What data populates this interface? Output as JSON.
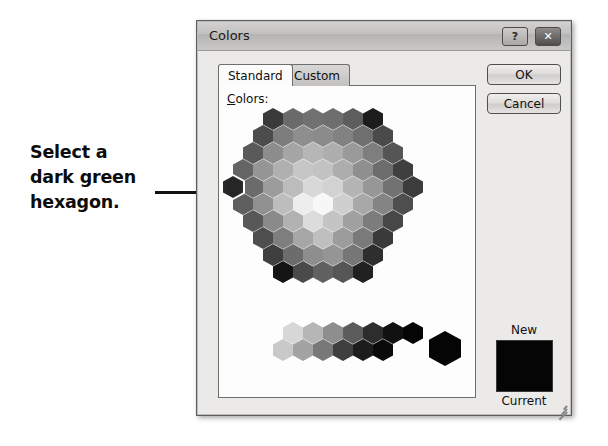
{
  "annotation": {
    "lines": [
      "Select a",
      "dark green",
      "hexagon."
    ],
    "leader_line": "pointer-line"
  },
  "dialog": {
    "title": "Colors",
    "titlebar_buttons": [
      {
        "name": "help-button",
        "glyph": "?"
      },
      {
        "name": "close-button",
        "glyph": "✕"
      }
    ],
    "tabs": [
      {
        "label": "Standard",
        "active": true
      },
      {
        "label": "Custom",
        "active": false
      }
    ],
    "colors_label": {
      "accel": "C",
      "rest": "olors:"
    },
    "buttons": {
      "ok": "OK",
      "cancel": "Cancel"
    },
    "preview": {
      "new_label": "New",
      "current_label": "Current",
      "swatch_color": "#050505"
    }
  },
  "palette": {
    "selected_index": 30,
    "honeycomb_rows": [
      {
        "offset": 44,
        "colors": [
          "#3a3a3a",
          "#6a6a6a",
          "#717171",
          "#6e6e6e",
          "#5d5d5d",
          "#1d1d1d"
        ]
      },
      {
        "offset": 34,
        "colors": [
          "#4c4c4c",
          "#7d7d7d",
          "#8e8e8e",
          "#8b8b8b",
          "#828282",
          "#6f6f6f",
          "#4a4a4a"
        ]
      },
      {
        "offset": 24,
        "colors": [
          "#5a5a5a",
          "#8d8d8d",
          "#a5a5a5",
          "#b6b6b6",
          "#aeaeae",
          "#9a9a9a",
          "#7e7e7e",
          "#555555"
        ]
      },
      {
        "offset": 14,
        "colors": [
          "#646464",
          "#959595",
          "#b0b0b0",
          "#c6c6c6",
          "#c2c2c2",
          "#adadad",
          "#8f8f8f",
          "#6d6d6d",
          "#3f3f3f"
        ]
      },
      {
        "offset": 4,
        "colors": [
          "#2a2a2a",
          "#6b6b6b",
          "#9c9c9c",
          "#bcbcbc",
          "#d8d8d8",
          "#d2d2d2",
          "#b4b4b4",
          "#979797",
          "#727272",
          "#3c3c3c"
        ]
      },
      {
        "offset": 14,
        "colors": [
          "#5f5f5f",
          "#909090",
          "#bdbdbd",
          "#ededed",
          "#f7f7f7",
          "#cfcfcf",
          "#a8a8a8",
          "#848484",
          "#4e4e4e"
        ]
      },
      {
        "offset": 24,
        "colors": [
          "#585858",
          "#8a8a8a",
          "#b2b2b2",
          "#dcdcdc",
          "#c4c4c4",
          "#a0a0a0",
          "#7c7c7c",
          "#474747"
        ]
      },
      {
        "offset": 34,
        "colors": [
          "#4e4e4e",
          "#7e7e7e",
          "#a6a6a6",
          "#bfbfbf",
          "#9c9c9c",
          "#7a7a7a",
          "#3a3a3a"
        ]
      },
      {
        "offset": 44,
        "colors": [
          "#3f3f3f",
          "#6c6c6c",
          "#8e8e8e",
          "#959595",
          "#767676",
          "#2e2e2e"
        ]
      },
      {
        "offset": 54,
        "colors": [
          "#141414",
          "#4a4a4a",
          "#616161",
          "#565656",
          "#212121"
        ]
      }
    ],
    "gray_strip_rows": [
      {
        "offset": 64,
        "colors": [
          "#d7d7d7",
          "#b6b6b6",
          "#8e8e8e",
          "#5c5c5c",
          "#2d2d2d",
          "#111111",
          "#050505"
        ]
      },
      {
        "offset": 54,
        "colors": [
          "#c9c9c9",
          "#a3a3a3",
          "#787878",
          "#3f3f3f",
          "#1c1c1c",
          "#0a0a0a"
        ]
      }
    ],
    "big_hex_color": "#050505"
  }
}
